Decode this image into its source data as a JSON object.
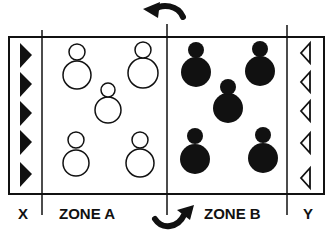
{
  "labels": {
    "x": "X",
    "zone_a": "ZONE A",
    "zone_b": "ZONE B",
    "y": "Y"
  },
  "diagram": {
    "colors": {
      "line": "#111111",
      "background": "#ffffff"
    },
    "zone_x": {
      "triangles": 5,
      "style": "filled",
      "direction": "right"
    },
    "zone_y": {
      "triangles": 5,
      "style": "outline",
      "direction": "left"
    },
    "zone_a": {
      "figures": 5,
      "style": "outline"
    },
    "zone_b": {
      "figures": 5,
      "style": "filled"
    },
    "arrows": [
      {
        "position": "top",
        "direction": "left"
      },
      {
        "position": "bottom",
        "direction": "right"
      }
    ]
  }
}
